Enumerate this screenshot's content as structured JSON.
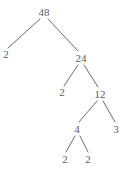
{
  "figure": {
    "kind": "factor-tree",
    "background_color": "#ffffff",
    "text_color": "#5d5d5d",
    "edge_color": "#6b6b6b",
    "width": 128,
    "height": 169
  },
  "chart_data": {
    "type": "diagram",
    "title": "",
    "diagram_kind": "factor-tree",
    "root_value": 48,
    "prime_factors": [
      2,
      2,
      2,
      2,
      3
    ],
    "nodes": [
      {
        "id": "n48",
        "label": "48",
        "value": 48,
        "x": 44,
        "y": 12,
        "is_leaf": false,
        "is_prime": false
      },
      {
        "id": "n2a",
        "label": "2",
        "value": 2,
        "x": 6,
        "y": 54,
        "is_leaf": true,
        "is_prime": true
      },
      {
        "id": "n24",
        "label": "24",
        "value": 24,
        "x": 81,
        "y": 58,
        "is_leaf": false,
        "is_prime": false
      },
      {
        "id": "n2b",
        "label": "2",
        "value": 2,
        "x": 62,
        "y": 92,
        "is_leaf": true,
        "is_prime": true
      },
      {
        "id": "n12",
        "label": "12",
        "value": 12,
        "x": 100,
        "y": 94,
        "is_leaf": false,
        "is_prime": false
      },
      {
        "id": "n4",
        "label": "4",
        "value": 4,
        "x": 77,
        "y": 129,
        "is_leaf": false,
        "is_prime": false
      },
      {
        "id": "n3",
        "label": "3",
        "value": 3,
        "x": 116,
        "y": 129,
        "is_leaf": true,
        "is_prime": true
      },
      {
        "id": "n2c",
        "label": "2",
        "value": 2,
        "x": 65,
        "y": 159,
        "is_leaf": true,
        "is_prime": true
      },
      {
        "id": "n2d",
        "label": "2",
        "value": 2,
        "x": 88,
        "y": 159,
        "is_leaf": true,
        "is_prime": true
      }
    ],
    "edges": [
      {
        "from": "n48",
        "to": "n2a",
        "x1": 40,
        "y1": 19,
        "x2": 8,
        "y2": 48
      },
      {
        "from": "n48",
        "to": "n24",
        "x1": 48,
        "y1": 19,
        "x2": 78,
        "y2": 51
      },
      {
        "from": "n24",
        "to": "n2b",
        "x1": 78,
        "y1": 65,
        "x2": 64,
        "y2": 86
      },
      {
        "from": "n24",
        "to": "n12",
        "x1": 84,
        "y1": 65,
        "x2": 98,
        "y2": 87
      },
      {
        "from": "n12",
        "to": "n4",
        "x1": 97,
        "y1": 101,
        "x2": 79,
        "y2": 122
      },
      {
        "from": "n12",
        "to": "n3",
        "x1": 103,
        "y1": 101,
        "x2": 115,
        "y2": 122
      },
      {
        "from": "n4",
        "to": "n2c",
        "x1": 75,
        "y1": 136,
        "x2": 66,
        "y2": 152
      },
      {
        "from": "n4",
        "to": "n2d",
        "x1": 80,
        "y1": 136,
        "x2": 88,
        "y2": 152
      }
    ]
  }
}
